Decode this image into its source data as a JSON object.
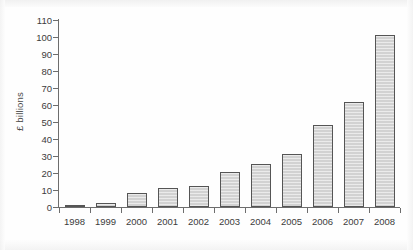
{
  "chart_data": {
    "type": "bar",
    "title": "",
    "subtitle": "",
    "xlabel": "",
    "ylabel": "£ billions",
    "categories": [
      "1998",
      "1999",
      "2000",
      "2001",
      "2002",
      "2003",
      "2004",
      "2005",
      "2006",
      "2007",
      "2008"
    ],
    "values": [
      0.3,
      2.5,
      8,
      11,
      12.5,
      20.5,
      25.5,
      31,
      48.5,
      62,
      101
    ],
    "ylim": [
      0,
      110
    ],
    "ytick_values": [
      0,
      10,
      20,
      30,
      40,
      50,
      60,
      70,
      80,
      90,
      100,
      110
    ],
    "ytick_labels": [
      "0",
      "10",
      "20",
      "30",
      "40",
      "50",
      "60",
      "70",
      "80",
      "90",
      "100",
      "110"
    ],
    "grid": false,
    "legend": null,
    "legend_position": "none",
    "series": [
      {
        "name": "£ billions",
        "values": [
          0.3,
          2.5,
          8,
          11,
          12.5,
          20.5,
          25.5,
          31,
          48.5,
          62,
          101
        ]
      }
    ],
    "colors": {
      "bar_fill": "#d2d2d2",
      "bar_border": "#555555",
      "axis": "#6d6d6d",
      "text": "#3c3c3c",
      "background": "#fefefe"
    }
  }
}
